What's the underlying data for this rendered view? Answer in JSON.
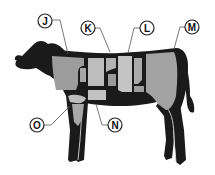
{
  "diagram": {
    "colors": {
      "body": "#1a1a1a",
      "cut_light": "#c8c8c8",
      "cut_mid": "#a8a8a8",
      "cut_dark": "#8e8e8e",
      "leader": "#555555",
      "label_fill": "#ffffff",
      "label_stroke": "#222222"
    },
    "labels": [
      {
        "id": "J",
        "text": "J"
      },
      {
        "id": "K",
        "text": "K"
      },
      {
        "id": "L",
        "text": "L"
      },
      {
        "id": "M",
        "text": "M"
      },
      {
        "id": "N",
        "text": "N"
      },
      {
        "id": "O",
        "text": "O"
      }
    ]
  }
}
